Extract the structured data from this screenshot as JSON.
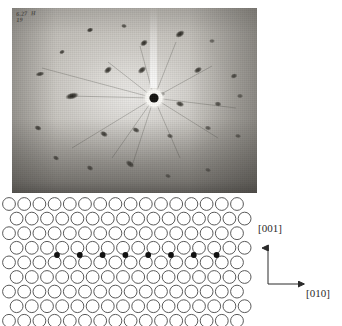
{
  "figure": {
    "type": "laue-diffraction-figure",
    "panels": [
      "laue-photograph",
      "crystal-lattice-schematic"
    ]
  },
  "photograph": {
    "name": "laue-photograph",
    "handwritten_annotation": "6.27  H\n19",
    "center_beam_label": "direct-beam-stop",
    "bounds": {
      "x": 12,
      "y": 8,
      "width": 245,
      "height": 185
    },
    "spots": [
      {
        "cx": 78,
        "cy": 22,
        "rx": 3.4,
        "ry": 2.4,
        "rot": -20,
        "o": 0.88
      },
      {
        "cx": 112,
        "cy": 18,
        "rx": 3.0,
        "ry": 2.2,
        "rot": 10,
        "o": 0.72
      },
      {
        "cx": 132,
        "cy": 35,
        "rx": 4.2,
        "ry": 3.0,
        "rot": -35,
        "o": 0.9
      },
      {
        "cx": 168,
        "cy": 26,
        "rx": 5.2,
        "ry": 3.2,
        "rot": -32,
        "o": 0.92
      },
      {
        "cx": 200,
        "cy": 33,
        "rx": 3.0,
        "ry": 2.2,
        "rot": 0,
        "o": 0.55
      },
      {
        "cx": 50,
        "cy": 44,
        "rx": 3.0,
        "ry": 2.2,
        "rot": -25,
        "o": 0.8
      },
      {
        "cx": 96,
        "cy": 62,
        "rx": 4.6,
        "ry": 3.0,
        "rot": -40,
        "o": 0.88
      },
      {
        "cx": 130,
        "cy": 62,
        "rx": 4.8,
        "ry": 3.0,
        "rot": -38,
        "o": 0.86
      },
      {
        "cx": 186,
        "cy": 62,
        "rx": 4.4,
        "ry": 2.8,
        "rot": -30,
        "o": 0.84
      },
      {
        "cx": 222,
        "cy": 68,
        "rx": 3.6,
        "ry": 2.6,
        "rot": -20,
        "o": 0.74
      },
      {
        "cx": 28,
        "cy": 66,
        "rx": 4.6,
        "ry": 2.4,
        "rot": -12,
        "o": 0.82
      },
      {
        "cx": 60,
        "cy": 88,
        "rx": 7.0,
        "ry": 3.4,
        "rot": -14,
        "o": 0.94
      },
      {
        "cx": 150,
        "cy": 86,
        "rx": 3.2,
        "ry": 2.4,
        "rot": 0,
        "o": 0.55
      },
      {
        "cx": 168,
        "cy": 96,
        "rx": 4.4,
        "ry": 2.8,
        "rot": 18,
        "o": 0.82
      },
      {
        "cx": 206,
        "cy": 96,
        "rx": 3.6,
        "ry": 2.6,
        "rot": 10,
        "o": 0.7
      },
      {
        "cx": 228,
        "cy": 88,
        "rx": 3.2,
        "ry": 2.4,
        "rot": 0,
        "o": 0.58
      },
      {
        "cx": 26,
        "cy": 120,
        "rx": 3.8,
        "ry": 2.6,
        "rot": 20,
        "o": 0.8
      },
      {
        "cx": 92,
        "cy": 126,
        "rx": 4.2,
        "ry": 2.8,
        "rot": 28,
        "o": 0.82
      },
      {
        "cx": 124,
        "cy": 122,
        "rx": 4.0,
        "ry": 2.6,
        "rot": 25,
        "o": 0.78
      },
      {
        "cx": 158,
        "cy": 128,
        "rx": 3.4,
        "ry": 2.4,
        "rot": 20,
        "o": 0.66
      },
      {
        "cx": 196,
        "cy": 120,
        "rx": 3.4,
        "ry": 2.4,
        "rot": 15,
        "o": 0.62
      },
      {
        "cx": 226,
        "cy": 128,
        "rx": 3.2,
        "ry": 2.2,
        "rot": 10,
        "o": 0.58
      },
      {
        "cx": 44,
        "cy": 150,
        "rx": 3.4,
        "ry": 2.4,
        "rot": 30,
        "o": 0.7
      },
      {
        "cx": 78,
        "cy": 160,
        "rx": 3.6,
        "ry": 2.6,
        "rot": 30,
        "o": 0.68
      },
      {
        "cx": 118,
        "cy": 156,
        "rx": 5.0,
        "ry": 3.0,
        "rot": 38,
        "o": 0.76
      },
      {
        "cx": 156,
        "cy": 168,
        "rx": 3.2,
        "ry": 2.2,
        "rot": 20,
        "o": 0.55
      },
      {
        "cx": 196,
        "cy": 162,
        "rx": 3.2,
        "ry": 2.2,
        "rot": 18,
        "o": 0.52
      }
    ],
    "center": {
      "cx": 142,
      "cy": 90,
      "halo_r": 11,
      "core_r": 4.6
    }
  },
  "lattice": {
    "name": "crystal-lattice-schematic",
    "description": "close-packed atom rows with interstitial row",
    "circle_radius": 6.4,
    "circle_stroke": "#5a5a5a",
    "x_spacing": 15.2,
    "y_spacing": 14.6,
    "row_offset": 7.6,
    "origin_x": 9,
    "origin_y": 8,
    "rows": 9,
    "cols": 17,
    "filled_row_index": 4,
    "filled_dots_count": 8,
    "filled_dot_radius": 2.9,
    "filled_dot_color": "#111111",
    "filled_dot_start_x": 57,
    "filled_dot_spacing": 22.8,
    "filled_dot_y": 59
  },
  "axes": {
    "name": "crystallographic-axes",
    "vertical_label": "[001]",
    "horizontal_label": "[010]",
    "origin": {
      "x": 268,
      "y": 88
    },
    "vertical_length": 36,
    "horizontal_length": 36,
    "color": "#2b2b2b"
  }
}
